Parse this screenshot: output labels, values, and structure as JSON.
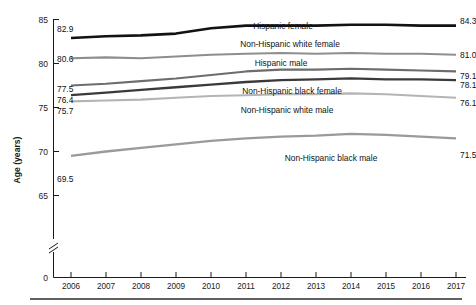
{
  "chart_data": {
    "type": "line",
    "title": "",
    "subtitle": "",
    "xlabel": "",
    "ylabel": "Age (years)",
    "x": [
      2006,
      2007,
      2008,
      2009,
      2010,
      2011,
      2012,
      2013,
      2014,
      2015,
      2016,
      2017
    ],
    "xticklabels": [
      "2006",
      "2007",
      "2008",
      "2009",
      "2010",
      "2011",
      "2012",
      "2013",
      "2014",
      "2015",
      "2016",
      "2017"
    ],
    "yticklabels": [
      "0",
      "65",
      "70",
      "75",
      "80",
      "85"
    ],
    "ytickvalues": [
      0,
      65,
      70,
      75,
      80,
      85
    ],
    "ylim": [
      65,
      85
    ],
    "y_axis_break": true,
    "grid": false,
    "legend_position": "inline-labels",
    "series": [
      {
        "name": "Hispanic female",
        "label": "Hispanic female",
        "color": "#121212",
        "width": 2.6,
        "start_value": "82.9",
        "end_value": "84.3",
        "values": [
          82.9,
          83.1,
          83.2,
          83.4,
          84.0,
          84.3,
          84.3,
          84.3,
          84.4,
          84.4,
          84.3,
          84.3
        ]
      },
      {
        "name": "Non-Hispanic white female",
        "label": "Non-Hispanic white female",
        "color": "#8e8e8e",
        "width": 2.1,
        "start_value": "80.6",
        "end_value": "81.0",
        "values": [
          80.6,
          80.7,
          80.6,
          80.8,
          81.0,
          81.1,
          81.2,
          81.1,
          81.2,
          81.1,
          81.1,
          81.0
        ]
      },
      {
        "name": "Hispanic male",
        "label": "Hispanic male",
        "color": "#6d6d6d",
        "width": 2.1,
        "start_value": "77.5",
        "end_value": "79.1",
        "values": [
          77.5,
          77.7,
          78.0,
          78.3,
          78.7,
          79.1,
          79.3,
          79.3,
          79.4,
          79.3,
          79.2,
          79.1
        ]
      },
      {
        "name": "Non-Hispanic black female",
        "label": "Non-Hispanic black female",
        "color": "#3a3a3a",
        "width": 2.3,
        "start_value": "76.4",
        "end_value": "78.1",
        "values": [
          76.4,
          76.7,
          77.0,
          77.3,
          77.6,
          77.9,
          78.1,
          78.2,
          78.3,
          78.2,
          78.2,
          78.1
        ]
      },
      {
        "name": "Non-Hispanic white male",
        "label": "Non-Hispanic white male",
        "color": "#b4b4b4",
        "width": 2.1,
        "start_value": "75.7",
        "end_value": "76.1",
        "values": [
          75.7,
          75.8,
          75.9,
          76.1,
          76.3,
          76.4,
          76.5,
          76.5,
          76.6,
          76.5,
          76.3,
          76.1
        ]
      },
      {
        "name": "Non-Hispanic black male",
        "label": "Non-Hispanic black male",
        "color": "#9a9a9a",
        "width": 2.3,
        "start_value": "69.5",
        "end_value": "71.5",
        "values": [
          69.5,
          70.0,
          70.4,
          70.8,
          71.2,
          71.5,
          71.7,
          71.8,
          72.0,
          71.9,
          71.7,
          71.5
        ]
      }
    ]
  },
  "axis": {
    "y_title": "Age (years)",
    "zero_label": "0"
  },
  "labels": {
    "hispanic_female": "Hispanic female",
    "nh_white_female": "Non-Hispanic white female",
    "hispanic_male": "Hispanic male",
    "nh_black_female": "Non-Hispanic black female",
    "nh_white_male": "Non-Hispanic white male",
    "nh_black_male": "Non-Hispanic black male"
  },
  "start_values": {
    "hispanic_female": "82.9",
    "nh_white_female": "80.6",
    "hispanic_male": "77.5",
    "nh_black_female": "76.4",
    "nh_white_male": "75.7",
    "nh_black_male": "69.5"
  },
  "end_values": {
    "hispanic_female": "84.3",
    "nh_white_female": "81.0",
    "hispanic_male": "79.1",
    "nh_black_female": "78.1",
    "nh_white_male": "76.1",
    "nh_black_male": "71.5"
  },
  "yticks": {
    "t85": "85",
    "t80": "80",
    "t75": "75",
    "t70": "70",
    "t65": "65",
    "t0": "0"
  },
  "xticks": {
    "x2006": "2006",
    "x2007": "2007",
    "x2008": "2008",
    "x2009": "2009",
    "x2010": "2010",
    "x2011": "2011",
    "x2012": "2012",
    "x2013": "2013",
    "x2014": "2014",
    "x2015": "2015",
    "x2016": "2016",
    "x2017": "2017"
  }
}
